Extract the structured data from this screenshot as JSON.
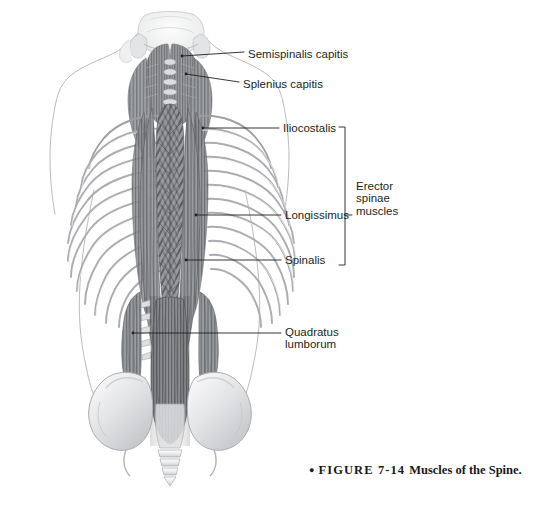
{
  "figure": {
    "labels": [
      {
        "id": "semispinalis-capitis",
        "text": "Semispinalis capitis",
        "x": 248,
        "y": 48
      },
      {
        "id": "splenius-capitis",
        "text": "Splenius capitis",
        "x": 243,
        "y": 78
      },
      {
        "id": "iliocostalis",
        "text": "Iliocostalis",
        "x": 283,
        "y": 122
      },
      {
        "id": "longissimus",
        "text": "Longissimus",
        "x": 285,
        "y": 209
      },
      {
        "id": "spinalis",
        "text": "Spinalis",
        "x": 285,
        "y": 254
      },
      {
        "id": "quadratus-lumborum",
        "text": "Quadratus\nlumborum",
        "x": 285,
        "y": 326
      }
    ],
    "bracket_label": {
      "id": "erector-spinae-muscles",
      "line1": "Erector",
      "line2": "spinae",
      "line3": "muscles",
      "x": 356,
      "y": 180
    },
    "caption": {
      "bullet": "●",
      "figure_number": "FIGURE 7-14",
      "title": "Muscles of the Spine.",
      "x": 309,
      "y": 460
    },
    "colors": {
      "background": "#ffffff",
      "label_text": "#231f20",
      "leader_line": "#231f20",
      "outline": "#b9b9bc",
      "muscle_dark": "#5f6063",
      "muscle_mid": "#8a8c8f",
      "muscle_light": "#c3c5c8",
      "bone_light": "#e4e5e7",
      "caption_text": "#1a1a1a"
    }
  }
}
